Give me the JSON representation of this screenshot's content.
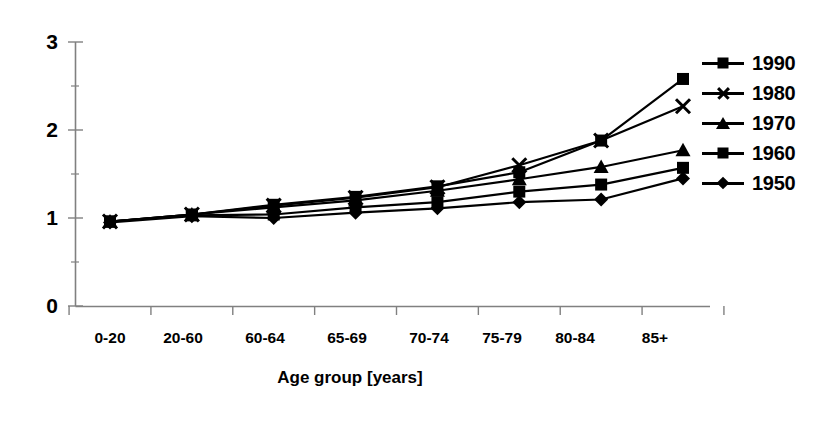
{
  "chart_data": {
    "type": "line",
    "title": "",
    "xlabel": "Age group [years]",
    "ylabel": "",
    "categories": [
      "0-20",
      "20-60",
      "60-64",
      "65-69",
      "70-74",
      "75-79",
      "80-84",
      "85+"
    ],
    "ylim": [
      0,
      3
    ],
    "yticks": [
      "0",
      "1",
      "2",
      "3"
    ],
    "grid": false,
    "legend_position": "right",
    "series": [
      {
        "name": "1990",
        "marker": "square",
        "values": [
          0.96,
          1.04,
          1.15,
          1.24,
          1.36,
          1.52,
          1.88,
          2.58
        ]
      },
      {
        "name": "1980",
        "marker": "x",
        "values": [
          0.96,
          1.04,
          1.14,
          1.23,
          1.35,
          1.6,
          1.88,
          2.27
        ]
      },
      {
        "name": "1970",
        "marker": "triangle",
        "values": [
          0.96,
          1.04,
          1.12,
          1.2,
          1.31,
          1.44,
          1.58,
          1.77
        ]
      },
      {
        "name": "1960",
        "marker": "square",
        "values": [
          0.96,
          1.03,
          1.04,
          1.12,
          1.18,
          1.3,
          1.38,
          1.57
        ]
      },
      {
        "name": "1950",
        "marker": "diamond",
        "values": [
          0.95,
          1.02,
          1.0,
          1.06,
          1.11,
          1.18,
          1.21,
          1.45
        ]
      }
    ]
  },
  "axis": {
    "y_tick_labels": [
      "3",
      "2",
      "1",
      "0"
    ],
    "x_title": "Age group [years]"
  },
  "legend": {
    "items": [
      {
        "label": "1990",
        "marker": "square"
      },
      {
        "label": "1980",
        "marker": "x"
      },
      {
        "label": "1970",
        "marker": "triangle"
      },
      {
        "label": "1960",
        "marker": "square"
      },
      {
        "label": "1950",
        "marker": "diamond"
      }
    ]
  },
  "colors": {
    "line": "#000000",
    "axis": "#808080",
    "background": "#ffffff"
  }
}
